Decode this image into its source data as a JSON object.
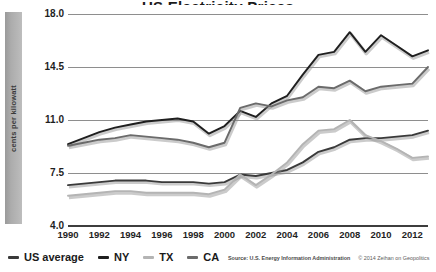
{
  "chart_data": {
    "type": "line",
    "title": "US Electricity Prices",
    "xlabel": "",
    "ylabel": "cents per kilowatt",
    "ylim": [
      4.0,
      18.0
    ],
    "xlim": [
      1990,
      2013
    ],
    "grid": true,
    "y_ticks": [
      "18.0",
      "14.5",
      "11.0",
      "7.5",
      "4.0"
    ],
    "y_tick_values": [
      18.0,
      14.5,
      11.0,
      7.5,
      4.0
    ],
    "x_ticks": [
      "1990",
      "1992",
      "1994",
      "1996",
      "1998",
      "2000",
      "2002",
      "2004",
      "2006",
      "2008",
      "2010",
      "2012"
    ],
    "x": [
      1990,
      1991,
      1992,
      1993,
      1994,
      1995,
      1996,
      1997,
      1998,
      1999,
      2000,
      2001,
      2002,
      2003,
      2004,
      2005,
      2006,
      2007,
      2008,
      2009,
      2010,
      2011,
      2012,
      2013
    ],
    "legend_position": "bottom-left",
    "series": [
      {
        "name": "US average",
        "color": "#3a3a3a",
        "values": [
          6.7,
          6.8,
          6.9,
          7.0,
          7.0,
          7.0,
          6.9,
          6.9,
          6.9,
          6.8,
          6.9,
          7.4,
          7.3,
          7.5,
          7.7,
          8.2,
          8.9,
          9.2,
          9.7,
          9.8,
          9.8,
          9.9,
          10.0,
          10.3
        ]
      },
      {
        "name": "NY",
        "color": "#1f1f1f",
        "values": [
          9.4,
          9.8,
          10.2,
          10.5,
          10.7,
          10.9,
          11.0,
          11.1,
          10.9,
          10.1,
          10.6,
          11.6,
          11.2,
          12.1,
          12.6,
          14.0,
          15.3,
          15.5,
          16.8,
          15.5,
          16.6,
          15.9,
          15.2,
          15.6
        ]
      },
      {
        "name": "TX",
        "color": "#b4b4b4",
        "values": [
          6.0,
          6.1,
          6.2,
          6.3,
          6.3,
          6.2,
          6.2,
          6.2,
          6.2,
          6.1,
          6.4,
          7.4,
          6.7,
          7.4,
          8.2,
          9.4,
          10.3,
          10.4,
          11.0,
          10.0,
          9.6,
          9.1,
          8.5,
          8.6
        ]
      },
      {
        "name": "CA",
        "color": "#6b6b6b",
        "values": [
          9.3,
          9.5,
          9.7,
          9.8,
          10.0,
          9.9,
          9.8,
          9.7,
          9.5,
          9.2,
          9.5,
          11.8,
          12.1,
          11.9,
          12.3,
          12.5,
          13.2,
          13.1,
          13.6,
          12.9,
          13.2,
          13.3,
          13.4,
          14.5
        ]
      }
    ],
    "source": "Source: U.S. Energy Information Administration",
    "copyright": "© 2014 Zeihan on Geopolitics"
  },
  "legend": {
    "items": [
      {
        "label": "US average",
        "color": "#3a3a3a"
      },
      {
        "label": "NY",
        "color": "#1f1f1f"
      },
      {
        "label": "TX",
        "color": "#b4b4b4"
      },
      {
        "label": "CA",
        "color": "#6b6b6b"
      }
    ]
  }
}
